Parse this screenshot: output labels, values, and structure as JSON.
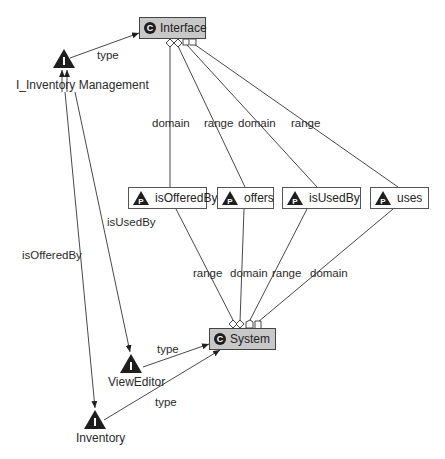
{
  "diagram": {
    "classes": [
      {
        "id": "interface",
        "label": "Interface",
        "badge": "C"
      },
      {
        "id": "system",
        "label": "System",
        "badge": "C"
      }
    ],
    "properties": [
      {
        "id": "isOfferedBy",
        "label": "isOfferedBy",
        "badge": "P"
      },
      {
        "id": "offers",
        "label": "offers",
        "badge": "P"
      },
      {
        "id": "isUsedBy",
        "label": "isUsedBy",
        "badge": "P"
      },
      {
        "id": "uses",
        "label": "uses",
        "badge": "P"
      }
    ],
    "individuals": [
      {
        "id": "i_inventory_management",
        "label": "I_Inventory Management",
        "badge": "I"
      },
      {
        "id": "vieweditor",
        "label": "ViewEditor",
        "badge": "I"
      },
      {
        "id": "inventory",
        "label": "Inventory",
        "badge": "I"
      }
    ],
    "edge_labels": {
      "iim_type": "type",
      "interface_domain_1": "domain",
      "interface_range_1": "range",
      "interface_domain_2": "domain",
      "interface_range_2": "range",
      "system_range_1": "range",
      "system_domain_1": "domain",
      "system_range_2": "range",
      "system_domain_2": "domain",
      "iim_isUsedBy": "isUsedBy",
      "iim_isOfferedBy": "isOfferedBy",
      "vieweditor_type": "type",
      "inventory_type": "type"
    },
    "edges": [
      {
        "from": "I_Inventory Management",
        "to": "Interface",
        "label": "type"
      },
      {
        "from": "isOfferedBy",
        "to": "Interface",
        "label": "domain"
      },
      {
        "from": "offers",
        "to": "Interface",
        "label": "range"
      },
      {
        "from": "isUsedBy",
        "to": "Interface",
        "label": "domain"
      },
      {
        "from": "uses",
        "to": "Interface",
        "label": "range"
      },
      {
        "from": "isOfferedBy",
        "to": "System",
        "label": "range"
      },
      {
        "from": "offers",
        "to": "System",
        "label": "domain"
      },
      {
        "from": "isUsedBy",
        "to": "System",
        "label": "range"
      },
      {
        "from": "uses",
        "to": "System",
        "label": "domain"
      },
      {
        "from": "I_Inventory Management",
        "to": "ViewEditor",
        "label": "isUsedBy"
      },
      {
        "from": "I_Inventory Management",
        "to": "Inventory",
        "label": "isOfferedBy"
      },
      {
        "from": "ViewEditor",
        "to": "System",
        "label": "type"
      },
      {
        "from": "Inventory",
        "to": "System",
        "label": "type"
      }
    ],
    "colors": {
      "class_fill": "#c8c8c8",
      "badge_dark": "#1e1e1e",
      "line": "#333333"
    }
  }
}
